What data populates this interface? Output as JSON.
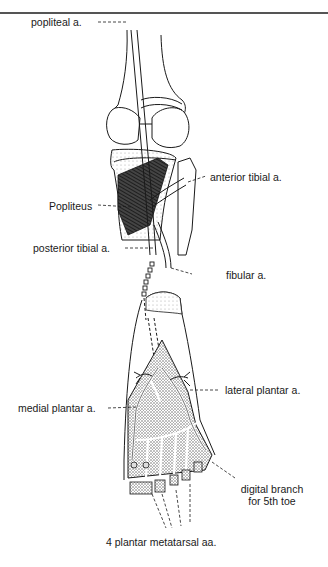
{
  "figure": {
    "labels": {
      "popliteal": "popliteal a.",
      "anterior_tibial": "anterior tibial a.",
      "popliteus": "Popliteus",
      "posterior_tibial": "posterior tibial a.",
      "fibular": "fibular  a.",
      "lateral_plantar": "lateral plantar a.",
      "medial_plantar": "medial plantar a.",
      "digital_branch_line1": "digital branch",
      "digital_branch_line2": "for 5th toe",
      "plantar_metatarsal": "4 plantar metatarsal aa."
    },
    "colors": {
      "ink": "#1a1a1a",
      "stipple": "#8a8a8a",
      "dark_muscle": "#3a3a3a",
      "background": "#ffffff"
    }
  }
}
